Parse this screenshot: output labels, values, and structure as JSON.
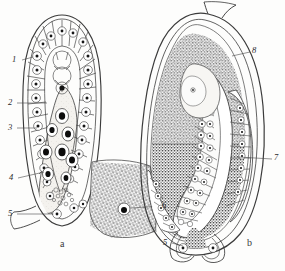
{
  "figure": {
    "kind": "scientific-line-drawing",
    "panels": [
      {
        "id": "a",
        "caption": "a",
        "callouts": [
          {
            "n": "1",
            "side": "left"
          },
          {
            "n": "2",
            "side": "left"
          },
          {
            "n": "3",
            "side": "left"
          },
          {
            "n": "4",
            "side": "left"
          },
          {
            "n": "5",
            "side": "left"
          },
          {
            "n": "6",
            "side": "right"
          }
        ]
      },
      {
        "id": "b",
        "caption": "b",
        "callouts": [
          {
            "n": "8",
            "side": "right-top"
          },
          {
            "n": "7",
            "side": "right"
          },
          {
            "n": "5",
            "side": "left-bottom"
          }
        ]
      }
    ],
    "colors": {
      "ink": "#2b2b2b",
      "line": "#3b3b3b",
      "stipple_dark": "#555555",
      "stipple_light": "#8a8a8a",
      "sac_fill": "#f3f1ec",
      "paper": "#fdfdfc",
      "nucleus": "#111111"
    }
  },
  "labels": {
    "a1": "1",
    "a2": "2",
    "a3": "3",
    "a4": "4",
    "a5": "5",
    "a6": "6",
    "b8": "8",
    "b7": "7",
    "b5": "5",
    "cap_a": "a",
    "cap_b": "b"
  },
  "footer": {
    "text": ""
  }
}
